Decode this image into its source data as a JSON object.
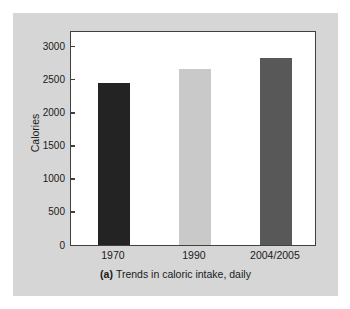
{
  "figure": {
    "caption_tag": "(a)",
    "caption_text": "Trends in caloric intake, daily",
    "panel_color": "#d6d6d6",
    "frame_color": "#404040",
    "plot_background": "#ffffff"
  },
  "chart_data": {
    "type": "bar",
    "title": "",
    "subtitle": "",
    "categories": [
      "1970",
      "1990",
      "2004/2005"
    ],
    "values": [
      2440,
      2660,
      2820
    ],
    "series": [
      {
        "name": "Daily caloric intake",
        "values": [
          2440,
          2660,
          2820
        ],
        "colors": [
          "#232323",
          "#c9c9c9",
          "#585858"
        ]
      }
    ],
    "xlabel": "",
    "ylabel": "Calories",
    "ylim": [
      0,
      3200
    ],
    "yticks": [
      0,
      500,
      1000,
      1500,
      2000,
      2500,
      3000
    ],
    "ytick_labels": [
      "0",
      "500",
      "1000",
      "1500",
      "2000",
      "2500",
      "3000"
    ],
    "grid": false,
    "legend": null,
    "annotations": []
  }
}
